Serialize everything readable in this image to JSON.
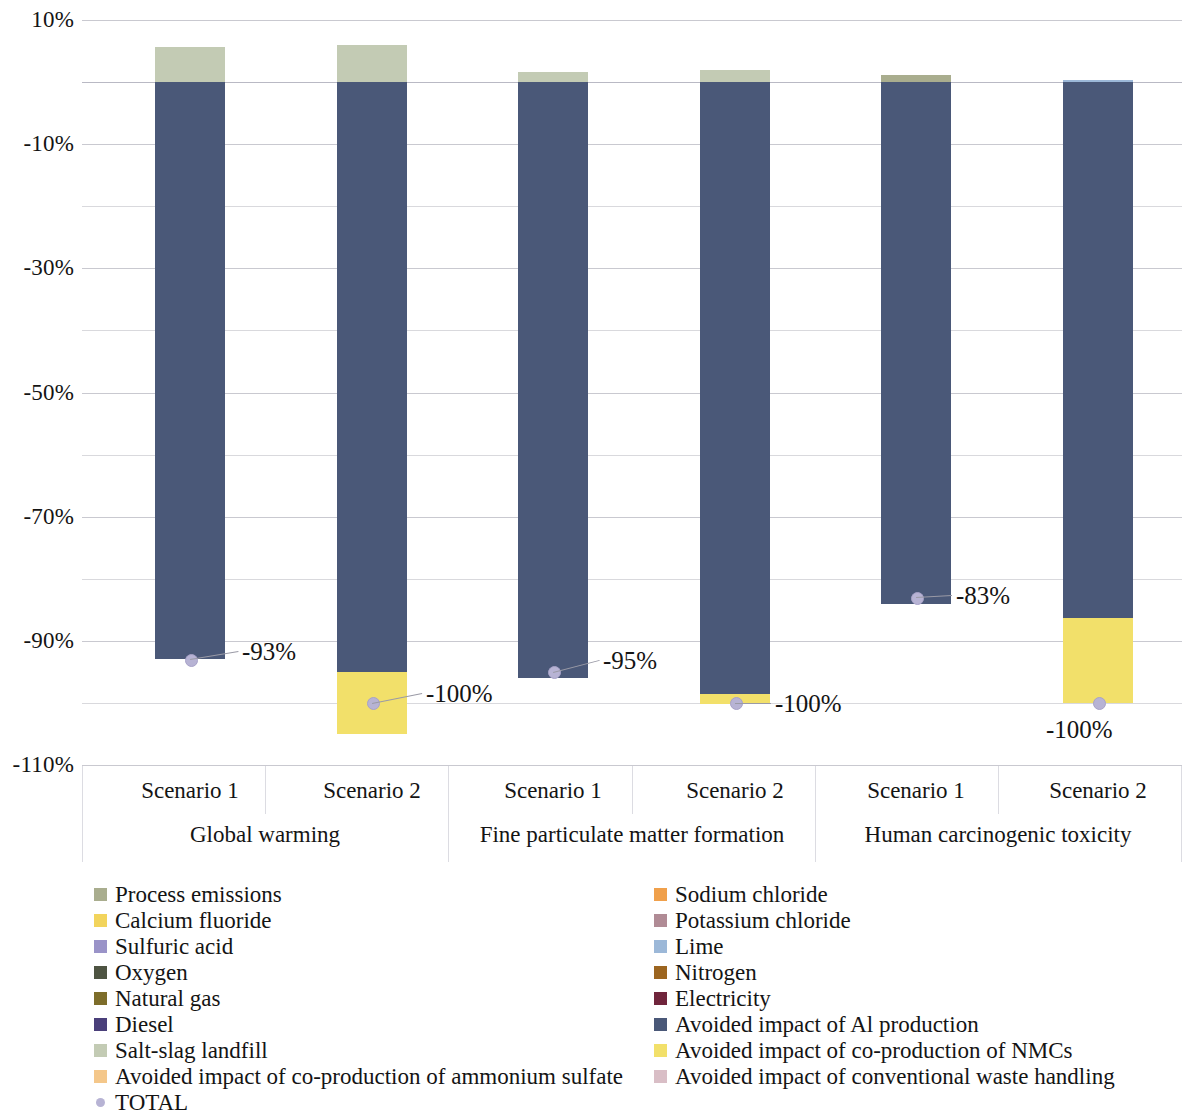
{
  "chart_data": {
    "type": "bar",
    "subtype": "stacked-bar-with-total-markers",
    "title": "",
    "xlabel": "",
    "ylabel": "",
    "ylim": [
      -110,
      10
    ],
    "ytick_labels": [
      "10%",
      "-10%",
      "-30%",
      "-50%",
      "-70%",
      "-90%",
      "-110%"
    ],
    "ytick_values": [
      10,
      -10,
      -30,
      -50,
      -70,
      -90,
      -110
    ],
    "minor_gridlines": [
      0,
      -20,
      -40,
      -60,
      -80,
      -100
    ],
    "grid": true,
    "legend_position": "bottom",
    "categories": [
      "Global warming",
      "Fine particulate matter formation",
      "Human carcinogenic toxicity"
    ],
    "scenario_labels": [
      "Scenario 1",
      "Scenario 2"
    ],
    "bars": [
      {
        "category": "Global warming",
        "scenario": "Scenario 1",
        "total": -93,
        "total_label": "-93%",
        "segments": [
          {
            "name": "Avoided impact of Al production",
            "value": -93.0
          },
          {
            "name": "Salt-slag landfill",
            "value": 1.1
          },
          {
            "name": "Natural gas",
            "value": 3.3
          },
          {
            "name": "Process emissions",
            "value": 1.2
          }
        ]
      },
      {
        "category": "Global warming",
        "scenario": "Scenario 2",
        "total": -100,
        "total_label": "-100%",
        "segments": [
          {
            "name": "Avoided impact of co-production of NMCs",
            "value": -10.0
          },
          {
            "name": "Avoided impact of Al production",
            "value": -95.0
          },
          {
            "name": "Salt-slag landfill",
            "value": 2.1
          },
          {
            "name": "Natural gas",
            "value": 3.4
          },
          {
            "name": "Diesel",
            "value": 0.4
          }
        ]
      },
      {
        "category": "Fine particulate matter formation",
        "scenario": "Scenario 1",
        "total": -95,
        "total_label": "-95%",
        "segments": [
          {
            "name": "Avoided impact of Al production",
            "value": -96.0
          },
          {
            "name": "Salt-slag landfill",
            "value": 0.6
          },
          {
            "name": "Natural gas",
            "value": 1.0
          }
        ]
      },
      {
        "category": "Fine particulate matter formation",
        "scenario": "Scenario 2",
        "total": -100,
        "total_label": "-100%",
        "segments": [
          {
            "name": "Avoided impact of co-production of NMCs",
            "value": -1.6
          },
          {
            "name": "Avoided impact of Al production",
            "value": -98.5
          },
          {
            "name": "Salt-slag landfill",
            "value": 0.5
          },
          {
            "name": "Electricity",
            "value": 1.5
          }
        ]
      },
      {
        "category": "Human carcinogenic toxicity",
        "scenario": "Scenario 1",
        "total": -83,
        "total_label": "-83%",
        "segments": [
          {
            "name": "Avoided impact of Al production",
            "value": -84.0
          },
          {
            "name": "Process emissions",
            "value": 1.1
          }
        ]
      },
      {
        "category": "Human carcinogenic toxicity",
        "scenario": "Scenario 2",
        "total": -100,
        "total_label": "-100%",
        "segments": [
          {
            "name": "Avoided impact of co-production of NMCs",
            "value": -13.7
          },
          {
            "name": "Avoided impact of Al production",
            "value": -86.3
          },
          {
            "name": "Lime",
            "value": 0.3
          }
        ]
      }
    ],
    "legend": [
      {
        "label": "Process emissions",
        "color": "#a9ad8e"
      },
      {
        "label": "Sodium chloride",
        "color": "#f0a04b"
      },
      {
        "label": "Calcium fluoride",
        "color": "#f2d45c"
      },
      {
        "label": "Potassium chloride",
        "color": "#b08b95"
      },
      {
        "label": "Sulfuric acid",
        "color": "#9a93c8"
      },
      {
        "label": "Lime",
        "color": "#9cb8d8"
      },
      {
        "label": "Oxygen",
        "color": "#4e5442"
      },
      {
        "label": "Nitrogen",
        "color": "#9c6520"
      },
      {
        "label": "Natural gas",
        "color": "#7d6d2a"
      },
      {
        "label": "Electricity",
        "color": "#70253c"
      },
      {
        "label": "Diesel",
        "color": "#4a3f7a"
      },
      {
        "label": "Avoided impact of Al production",
        "color": "#4a5878"
      },
      {
        "label": "Salt-slag landfill",
        "color": "#c3cbb4"
      },
      {
        "label": "Avoided impact of co-production of NMCs",
        "color": "#f2e06a"
      },
      {
        "label": "Avoided impact of co-production of ammonium sulfate",
        "color": "#f4c78a"
      },
      {
        "label": "Avoided impact of conventional waste handling",
        "color": "#d9bec6"
      },
      {
        "label": "TOTAL",
        "color": "#b7b3d4",
        "shape": "dot"
      }
    ],
    "colors": {
      "avoided_al": "#4a5878",
      "avoided_nmc": "#f2e06a",
      "natural_gas": "#7d6d2a",
      "salt_slag": "#c3cbb4",
      "process_emissions": "#a9ad8e",
      "electricity": "#70253c",
      "diesel": "#4a3f7a",
      "lime": "#9cb8d8",
      "total_marker": "#b7b3d4",
      "gridline": "#d9d9dd"
    }
  },
  "legend_columns": {
    "left": [
      {
        "label": "Process emissions",
        "color": "#a9ad8e"
      },
      {
        "label": "Calcium fluoride",
        "color": "#f2d45c"
      },
      {
        "label": "Sulfuric acid",
        "color": "#9a93c8"
      },
      {
        "label": "Oxygen",
        "color": "#4e5442"
      },
      {
        "label": "Natural gas",
        "color": "#7d6d2a"
      },
      {
        "label": "Diesel",
        "color": "#4a3f7a"
      },
      {
        "label": "Salt-slag landfill",
        "color": "#c3cbb4"
      },
      {
        "label": "Avoided impact of co-production of ammonium sulfate",
        "color": "#f4c78a"
      },
      {
        "label": "TOTAL",
        "color": "#b7b3d4",
        "shape": "dot"
      }
    ],
    "right": [
      {
        "label": "Sodium chloride",
        "color": "#f0a04b"
      },
      {
        "label": "Potassium chloride",
        "color": "#b08b95"
      },
      {
        "label": "Lime",
        "color": "#9cb8d8"
      },
      {
        "label": "Nitrogen",
        "color": "#9c6520"
      },
      {
        "label": "Electricity",
        "color": "#70253c"
      },
      {
        "label": "Avoided impact of Al production",
        "color": "#4a5878"
      },
      {
        "label": "Avoided impact of co-production of NMCs",
        "color": "#f2e06a"
      },
      {
        "label": "Avoided impact of conventional waste handling",
        "color": "#d9bec6"
      }
    ]
  }
}
